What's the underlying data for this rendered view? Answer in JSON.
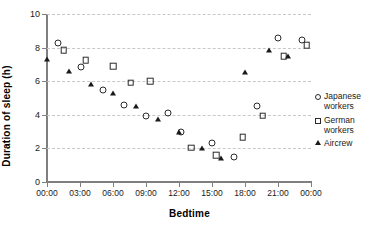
{
  "chart_data": {
    "type": "scatter",
    "title": "",
    "xlabel": "Bedtime",
    "ylabel": "Duration of sleep (h)",
    "xlim": [
      0,
      24
    ],
    "ylim": [
      0,
      10
    ],
    "x_tick_labels": [
      "00:00",
      "03:00",
      "06:00",
      "09:00",
      "12:00",
      "15:00",
      "18:00",
      "21:00",
      "00:00"
    ],
    "x_tick_values": [
      0,
      3,
      6,
      9,
      12,
      15,
      18,
      21,
      24
    ],
    "y_tick_labels": [
      "0",
      "2",
      "4",
      "6",
      "8",
      "10"
    ],
    "y_tick_values": [
      0,
      2,
      4,
      6,
      8,
      10
    ],
    "grid": "horizontal dashed",
    "legend_position": "right",
    "series": [
      {
        "name": "Japanese workers",
        "marker": "open-circle",
        "color": "#2b2b2b",
        "points": [
          {
            "x": 1.0,
            "y": 8.3
          },
          {
            "x": 3.1,
            "y": 6.85
          },
          {
            "x": 5.1,
            "y": 5.5
          },
          {
            "x": 7.0,
            "y": 4.6
          },
          {
            "x": 9.0,
            "y": 3.9
          },
          {
            "x": 11.0,
            "y": 4.1
          },
          {
            "x": 12.2,
            "y": 3.0
          },
          {
            "x": 15.0,
            "y": 2.3
          },
          {
            "x": 17.0,
            "y": 1.5
          },
          {
            "x": 19.1,
            "y": 4.5
          },
          {
            "x": 21.0,
            "y": 8.6
          },
          {
            "x": 23.2,
            "y": 8.45
          }
        ]
      },
      {
        "name": "German workers",
        "marker": "open-square",
        "color": "#2b2b2b",
        "points": [
          {
            "x": 1.5,
            "y": 7.85
          },
          {
            "x": 3.5,
            "y": 7.25
          },
          {
            "x": 6.0,
            "y": 6.9
          },
          {
            "x": 7.6,
            "y": 5.9
          },
          {
            "x": 9.4,
            "y": 6.0
          },
          {
            "x": 13.1,
            "y": 2.05
          },
          {
            "x": 15.4,
            "y": 1.6
          },
          {
            "x": 17.8,
            "y": 2.65
          },
          {
            "x": 19.6,
            "y": 3.95
          },
          {
            "x": 21.5,
            "y": 7.5
          },
          {
            "x": 23.6,
            "y": 8.15
          }
        ]
      },
      {
        "name": "Aircrew",
        "marker": "filled-triangle",
        "color": "#1a1a1a",
        "points": [
          {
            "x": 0.0,
            "y": 7.35
          },
          {
            "x": 2.0,
            "y": 6.6
          },
          {
            "x": 4.0,
            "y": 5.85
          },
          {
            "x": 6.0,
            "y": 5.3
          },
          {
            "x": 8.1,
            "y": 4.5
          },
          {
            "x": 10.1,
            "y": 3.75
          },
          {
            "x": 12.0,
            "y": 3.0
          },
          {
            "x": 14.1,
            "y": 2.0
          },
          {
            "x": 15.8,
            "y": 1.45
          },
          {
            "x": 18.0,
            "y": 6.55
          },
          {
            "x": 20.2,
            "y": 7.85
          },
          {
            "x": 21.9,
            "y": 7.5
          }
        ]
      }
    ]
  },
  "legend": {
    "items": [
      {
        "label_line1": "Japanese",
        "label_line2": "workers",
        "marker": "circle"
      },
      {
        "label_line1": "German",
        "label_line2": "workers",
        "marker": "square"
      },
      {
        "label_line1": "Aircrew",
        "label_line2": "",
        "marker": "triangle"
      }
    ]
  }
}
